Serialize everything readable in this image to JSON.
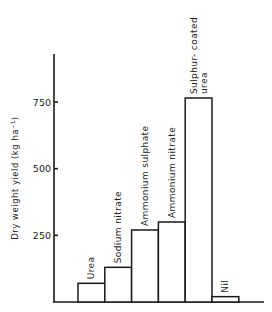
{
  "chart_data": {
    "type": "bar",
    "title": "",
    "xlabel": "",
    "ylabel": "Dry weight yield (kg ha⁻¹)",
    "categories": [
      "Urea",
      "Sodium nitrate",
      "Ammonium sulphate",
      "Ammonium nitrate",
      "Sulphur-coated urea",
      "Nil"
    ],
    "category_label_lines": [
      [
        "Urea"
      ],
      [
        "Sodium nitrate"
      ],
      [
        "Ammonium sulphate"
      ],
      [
        "Ammonium nitrate"
      ],
      [
        "Sulphur- coated",
        "urea"
      ],
      [
        "Nil"
      ]
    ],
    "values": [
      70,
      130,
      270,
      300,
      765,
      20
    ],
    "ylim": [
      0,
      950
    ],
    "yticks": [
      250,
      500,
      750
    ],
    "ytick_labels": [
      "250",
      "500",
      "750"
    ],
    "grid": false,
    "legend": null,
    "bar_style": {
      "fill": "#ffffff",
      "stroke": "#1a1a1a"
    }
  }
}
